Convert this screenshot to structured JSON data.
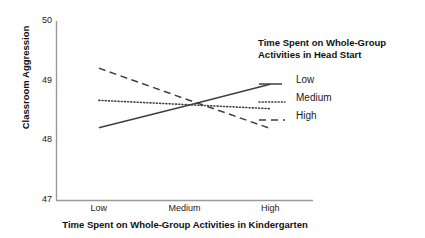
{
  "chart_data": {
    "type": "line",
    "title": "",
    "xlabel": "Time Spent on Whole-Group Activities in Kindergarten",
    "ylabel": "Classroom Aggression",
    "categories": [
      "Low",
      "Medium",
      "High"
    ],
    "x": [
      1,
      2,
      3
    ],
    "xlim": [
      0.5,
      3.5
    ],
    "ylim": [
      47,
      50
    ],
    "yticks": [
      "47",
      "48",
      "49",
      "50"
    ],
    "ytick_values": [
      47,
      48,
      49,
      50
    ],
    "grid": false,
    "legend_position": "right",
    "legend_title": "Time Spent on Whole-Group Activities in Head Start",
    "series": [
      {
        "name": "Low",
        "style": "solid",
        "color": "#3f3f3f",
        "values": [
          48.21,
          48.57,
          48.94
        ]
      },
      {
        "name": "Medium",
        "style": "dotted",
        "color": "#3f3f3f",
        "values": [
          48.67,
          48.6,
          48.53
        ]
      },
      {
        "name": "High",
        "style": "dashed",
        "color": "#3f3f3f",
        "values": [
          49.21,
          48.7,
          48.2
        ]
      }
    ]
  },
  "legend": {
    "title_line1": "Time Spent on Whole-Group",
    "title_line2": "Activities in Head Start",
    "items": [
      {
        "label": "Low"
      },
      {
        "label": "Medium"
      },
      {
        "label": "High"
      }
    ]
  },
  "axes": {
    "y_title": "Classroom Aggression",
    "x_title": "Time Spent on Whole-Group Activities in Kindergarten"
  }
}
